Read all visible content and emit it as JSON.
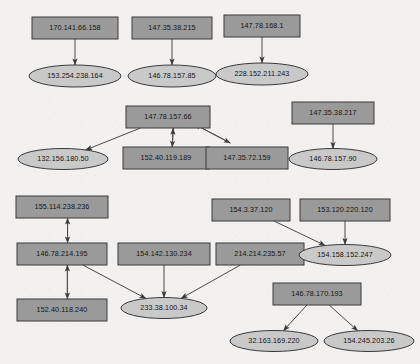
{
  "diagram": {
    "type": "directed-graph",
    "background_color": "#f2f1ef",
    "box_fill": "#9a9a9a",
    "ellipse_fill": "#c9c9c9",
    "border_color": "#3a3a3a",
    "edge_color": "#4a4a4a",
    "nodes": [
      {
        "id": "n1",
        "label": "170.141.66.158",
        "shape": "box",
        "x": 75,
        "y": 28,
        "w": 86,
        "h": 22
      },
      {
        "id": "n2",
        "label": "147.35.38.215",
        "shape": "box",
        "x": 172,
        "y": 28,
        "w": 80,
        "h": 22
      },
      {
        "id": "n3",
        "label": "147.78.168.1",
        "shape": "box",
        "x": 262,
        "y": 26,
        "w": 76,
        "h": 22
      },
      {
        "id": "n4",
        "label": "153.254.238.164",
        "shape": "ellipse",
        "x": 75,
        "y": 76,
        "w": 92,
        "h": 22
      },
      {
        "id": "n5",
        "label": "146.78.157.85",
        "shape": "ellipse",
        "x": 172,
        "y": 76,
        "w": 88,
        "h": 22
      },
      {
        "id": "n6",
        "label": "228.152.211.243",
        "shape": "ellipse",
        "x": 262,
        "y": 74,
        "w": 92,
        "h": 22
      },
      {
        "id": "n7",
        "label": "147.78.157.66",
        "shape": "box",
        "x": 168,
        "y": 117,
        "w": 84,
        "h": 22
      },
      {
        "id": "n8",
        "label": "147.35.38.217",
        "shape": "box",
        "x": 333,
        "y": 113,
        "w": 82,
        "h": 22
      },
      {
        "id": "n9",
        "label": "132.156.180.50",
        "shape": "ellipse",
        "x": 63,
        "y": 159,
        "w": 90,
        "h": 21
      },
      {
        "id": "n10",
        "label": "152.40.119.189",
        "shape": "box",
        "x": 166,
        "y": 158,
        "w": 86,
        "h": 22
      },
      {
        "id": "n11",
        "label": "147.35.72.159",
        "shape": "box",
        "x": 247,
        "y": 158,
        "w": 82,
        "h": 22
      },
      {
        "id": "n12",
        "label": "146.78.157.90",
        "shape": "ellipse",
        "x": 333,
        "y": 159,
        "w": 88,
        "h": 21
      },
      {
        "id": "n13",
        "label": "155.114.238.236",
        "shape": "box",
        "x": 62,
        "y": 207,
        "w": 92,
        "h": 22
      },
      {
        "id": "n14",
        "label": "154.3.37.120",
        "shape": "box",
        "x": 251,
        "y": 210,
        "w": 78,
        "h": 22
      },
      {
        "id": "n15",
        "label": "153.120.220.120",
        "shape": "box",
        "x": 345,
        "y": 210,
        "w": 90,
        "h": 22
      },
      {
        "id": "n16",
        "label": "146.78.214.195",
        "shape": "box",
        "x": 62,
        "y": 254,
        "w": 90,
        "h": 22
      },
      {
        "id": "n17",
        "label": "154.142.130.234",
        "shape": "box",
        "x": 164,
        "y": 254,
        "w": 92,
        "h": 22
      },
      {
        "id": "n18",
        "label": "214.214.235.57",
        "shape": "box",
        "x": 260,
        "y": 254,
        "w": 88,
        "h": 22
      },
      {
        "id": "n19",
        "label": "154.158.152.247",
        "shape": "ellipse",
        "x": 345,
        "y": 255,
        "w": 92,
        "h": 21
      },
      {
        "id": "n20",
        "label": "152.40.118.240",
        "shape": "box",
        "x": 62,
        "y": 310,
        "w": 90,
        "h": 22
      },
      {
        "id": "n21",
        "label": "233.38.100.34",
        "shape": "ellipse",
        "x": 164,
        "y": 308,
        "w": 86,
        "h": 21
      },
      {
        "id": "n22",
        "label": "146.78.170.193",
        "shape": "box",
        "x": 317,
        "y": 294,
        "w": 88,
        "h": 22
      },
      {
        "id": "n23",
        "label": "32.163.169.220",
        "shape": "ellipse",
        "x": 274,
        "y": 341,
        "w": 88,
        "h": 21
      },
      {
        "id": "n24",
        "label": "154.245.203.26",
        "shape": "ellipse",
        "x": 369,
        "y": 341,
        "w": 90,
        "h": 21
      }
    ],
    "edges": [
      {
        "from": "n1",
        "to": "n4",
        "directed": true
      },
      {
        "from": "n2",
        "to": "n5",
        "directed": true
      },
      {
        "from": "n3",
        "to": "n6",
        "directed": true
      },
      {
        "from": "n7",
        "to": "n9",
        "directed": true
      },
      {
        "from": "n7",
        "to": "n10",
        "directed": true
      },
      {
        "from": "n10",
        "to": "n7",
        "directed": true
      },
      {
        "from": "n7",
        "to": "n11",
        "directed": true
      },
      {
        "from": "n11",
        "to": "n7",
        "directed": true
      },
      {
        "from": "n8",
        "to": "n12",
        "directed": true
      },
      {
        "from": "n13",
        "to": "n16",
        "directed": true
      },
      {
        "from": "n16",
        "to": "n13",
        "directed": true
      },
      {
        "from": "n16",
        "to": "n20",
        "directed": true
      },
      {
        "from": "n20",
        "to": "n16",
        "directed": true
      },
      {
        "from": "n16",
        "to": "n21",
        "directed": true
      },
      {
        "from": "n17",
        "to": "n21",
        "directed": true
      },
      {
        "from": "n18",
        "to": "n21",
        "directed": true
      },
      {
        "from": "n14",
        "to": "n19",
        "directed": true
      },
      {
        "from": "n15",
        "to": "n19",
        "directed": true
      },
      {
        "from": "n22",
        "to": "n23",
        "directed": true
      },
      {
        "from": "n22",
        "to": "n24",
        "directed": true
      }
    ]
  }
}
